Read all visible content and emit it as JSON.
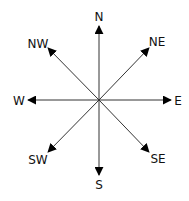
{
  "diagram": {
    "center": [
      99,
      100
    ],
    "directions": [
      {
        "id": "N",
        "label": "N"
      },
      {
        "id": "NE",
        "label": "NE"
      },
      {
        "id": "E",
        "label": "E"
      },
      {
        "id": "SE",
        "label": "SE"
      },
      {
        "id": "S",
        "label": "S"
      },
      {
        "id": "SW",
        "label": "SW"
      },
      {
        "id": "W",
        "label": "W"
      },
      {
        "id": "NW",
        "label": "NW"
      }
    ],
    "colors": {
      "line": "#333333",
      "arrow": "#000000",
      "text": "#111111",
      "background": "#ffffff"
    }
  }
}
